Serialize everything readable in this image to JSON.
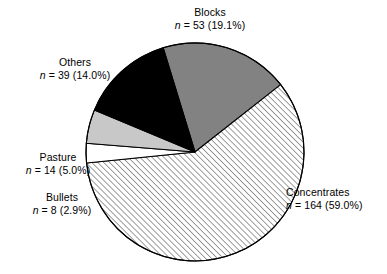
{
  "chart_data": {
    "type": "pie",
    "title": "",
    "subtitle": "",
    "xlabel": "",
    "ylabel": "",
    "legend_position": "none",
    "grid": false,
    "total_n": 278,
    "categories": [
      "Blocks",
      "Concentrates",
      "Bullets",
      "Pasture",
      "Others"
    ],
    "values": [
      53,
      164,
      8,
      14,
      39
    ],
    "percentages": [
      19.1,
      59.0,
      2.9,
      5.0,
      14.0
    ],
    "slices": [
      {
        "label": "Blocks",
        "n": 53,
        "percent": 19.1,
        "stat_text": "n = 53 (19.1%)",
        "fill": "#828282",
        "pattern": "solid",
        "start_angle": 343.0,
        "end_angle": 411.8
      },
      {
        "label": "Concentrates",
        "n": 164,
        "percent": 59.0,
        "stat_text": "n = 164 (59.0%)",
        "fill": "#ffffff",
        "pattern": "diagonal-hatch",
        "start_angle": 411.8,
        "end_angle": 624.2
      },
      {
        "label": "Bullets",
        "n": 8,
        "percent": 2.9,
        "stat_text": "n = 8 (2.9%)",
        "fill": "#ffffff",
        "pattern": "solid",
        "start_angle": 624.2,
        "end_angle": 634.6
      },
      {
        "label": "Pasture",
        "n": 14,
        "percent": 5.0,
        "stat_text": "n = 14 (5.0%)",
        "fill": "#c8c8c8",
        "pattern": "solid",
        "start_angle": 634.6,
        "end_angle": 652.6
      },
      {
        "label": "Others",
        "n": 39,
        "percent": 14.0,
        "stat_text": "n = 39 (14.0%)",
        "fill": "#000000",
        "pattern": "solid",
        "start_angle": 652.6,
        "end_angle": 703.0
      }
    ],
    "geometry": {
      "center_x": 195,
      "center_y": 152,
      "radius": 109
    },
    "colors": {
      "outline": "#000000",
      "blocks_gray": "#828282",
      "pasture_gray": "#c8c8c8",
      "others_black": "#000000",
      "concentrates_white": "#ffffff",
      "background": "#ffffff"
    }
  },
  "labels": {
    "blocks": {
      "name": "Blocks",
      "stat_prefix": "n",
      "stat_rest": " = 53 (19.1%)"
    },
    "concentrates": {
      "name": "Concentrates",
      "stat_prefix": "n",
      "stat_rest": " = 164 (59.0%)"
    },
    "bullets": {
      "name": "Bullets",
      "stat_prefix": "n",
      "stat_rest": " = 8 (2.9%)"
    },
    "pasture": {
      "name": "Pasture",
      "stat_prefix": "n",
      "stat_rest": " = 14 (5.0%)"
    },
    "others": {
      "name": "Others",
      "stat_prefix": "n",
      "stat_rest": " = 39 (14.0%)"
    }
  }
}
